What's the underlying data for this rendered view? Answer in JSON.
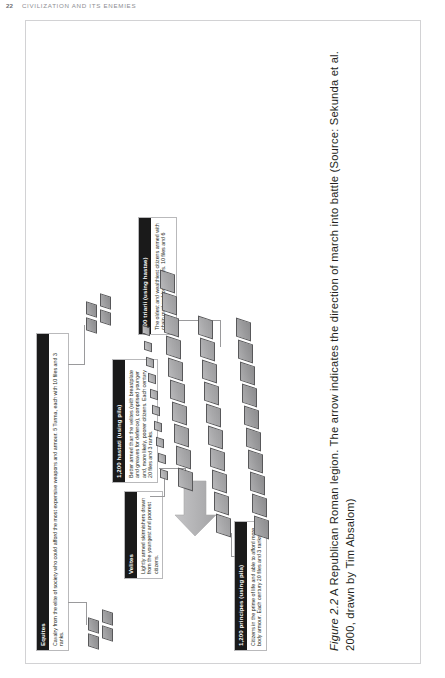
{
  "page": {
    "folio": "22",
    "running_title": "CIVILIZATION AND ITS ENEMIES"
  },
  "caption": {
    "label": "Figure 2.2",
    "text": "  A Republican Roman legion. The arrow indicates the direction of march into battle (Source: Sekunda et al. 2000, drawn by Tim Absalom)"
  },
  "callouts": [
    {
      "id": "equites",
      "header": "Equites",
      "body": "Cavalry from the elite of society who could afford the most expensive weapons and armour. 5 Turma, each with 10 files and 3 ranks."
    },
    {
      "id": "velites",
      "header": "Velites",
      "body": "Lightly armed skirmishers drawn from the youngest and poorest citizens."
    },
    {
      "id": "hastati",
      "header": "1,200 hastati (using pila)",
      "body": "Better armed than the velites (with breastplate and greaves for defence), comprised younger and, more likely, poorer citizens. Each century 20 files and 3 ranks."
    },
    {
      "id": "principes",
      "header": "1,200 principes (using pila)",
      "body": "Citizens in the prime of life and able to afford more body armour. Each century 20 files and 3 ranks."
    },
    {
      "id": "triarii",
      "header": "600 triarii (using hastae)",
      "body": "The oldest and wealthiest citizens armed with chain mail and long spears. 10 files and 6 ranks."
    }
  ],
  "arrow": {
    "name": "direction-of-march-arrow",
    "meaning": "direction of march into battle"
  },
  "formation": {
    "rows": [
      {
        "name": "equites-left",
        "count": 3,
        "size": "cavalry"
      },
      {
        "name": "equites-right",
        "count": 4,
        "size": "cavalry"
      },
      {
        "name": "velites",
        "count": 10,
        "size": "small"
      },
      {
        "name": "hastati",
        "count": 10,
        "size": "large"
      },
      {
        "name": "principes",
        "count": 10,
        "size": "large"
      },
      {
        "name": "triarii",
        "count": 10,
        "size": "large"
      }
    ]
  },
  "colors": {
    "unit_fill": "#a9a9ab",
    "unit_stroke": "#58585a",
    "callout_header_bg": "#1a1a1a",
    "callout_header_text": "#ffffff",
    "frame_border": "#d2d2d4",
    "arrow_fill": "#b4b4b6",
    "text": "#231f20"
  }
}
